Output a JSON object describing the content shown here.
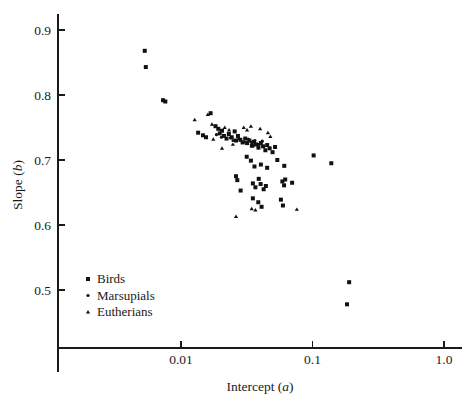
{
  "chart_data": {
    "type": "scatter",
    "title": "",
    "xlabel": "Intercept (a)",
    "xlabel_plain": "Intercept",
    "xlabel_symbol": "a",
    "ylabel": "Slope (b)",
    "ylabel_plain": "Slope",
    "ylabel_symbol": "b",
    "xscale": "log",
    "yscale": "linear",
    "xlim": [
      0.0022,
      1.15
    ],
    "ylim": [
      0.44,
      0.925
    ],
    "xticks": [
      0.01,
      0.1,
      1.0
    ],
    "xtick_labels": [
      "0.01",
      "0.1",
      "1.0"
    ],
    "yticks": [
      0.5,
      0.6,
      0.7,
      0.8,
      0.9
    ],
    "ytick_labels": [
      "0.5",
      "0.6",
      "0.7",
      "0.8",
      "0.9"
    ],
    "grid": false,
    "legend_position": "lower-left",
    "marker_colors": {
      "birds": "#111111",
      "marsupials": "#111111",
      "eutherians": "#111111"
    },
    "series": [
      {
        "name": "Birds",
        "key": "birds",
        "marker": "square",
        "marker_size": 4.0,
        "points": [
          [
            0.0053,
            0.868
          ],
          [
            0.0054,
            0.843
          ],
          [
            0.0073,
            0.792
          ],
          [
            0.0076,
            0.79
          ],
          [
            0.0168,
            0.772
          ],
          [
            0.0135,
            0.742
          ],
          [
            0.0147,
            0.738
          ],
          [
            0.0155,
            0.735
          ],
          [
            0.0183,
            0.752
          ],
          [
            0.0192,
            0.748
          ],
          [
            0.0197,
            0.741
          ],
          [
            0.0205,
            0.745
          ],
          [
            0.0212,
            0.737
          ],
          [
            0.0222,
            0.733
          ],
          [
            0.0231,
            0.74
          ],
          [
            0.0243,
            0.735
          ],
          [
            0.0256,
            0.744
          ],
          [
            0.0262,
            0.73
          ],
          [
            0.0271,
            0.737
          ],
          [
            0.0283,
            0.731
          ],
          [
            0.0294,
            0.727
          ],
          [
            0.0308,
            0.733
          ],
          [
            0.0318,
            0.726
          ],
          [
            0.0331,
            0.73
          ],
          [
            0.0346,
            0.722
          ],
          [
            0.0359,
            0.728
          ],
          [
            0.0372,
            0.724
          ],
          [
            0.0388,
            0.719
          ],
          [
            0.0405,
            0.726
          ],
          [
            0.0421,
            0.721
          ],
          [
            0.0438,
            0.715
          ],
          [
            0.0452,
            0.723
          ],
          [
            0.0472,
            0.718
          ],
          [
            0.0497,
            0.712
          ],
          [
            0.0519,
            0.72
          ],
          [
            0.0316,
            0.705
          ],
          [
            0.034,
            0.699
          ],
          [
            0.0362,
            0.69
          ],
          [
            0.0405,
            0.693
          ],
          [
            0.0452,
            0.688
          ],
          [
            0.0262,
            0.675
          ],
          [
            0.0268,
            0.669
          ],
          [
            0.0352,
            0.664
          ],
          [
            0.0368,
            0.658
          ],
          [
            0.039,
            0.671
          ],
          [
            0.0403,
            0.663
          ],
          [
            0.0425,
            0.655
          ],
          [
            0.0442,
            0.66
          ],
          [
            0.0352,
            0.641
          ],
          [
            0.0387,
            0.635
          ],
          [
            0.041,
            0.628
          ],
          [
            0.059,
            0.667
          ],
          [
            0.0608,
            0.661
          ],
          [
            0.062,
            0.67
          ],
          [
            0.07,
            0.665
          ],
          [
            0.0575,
            0.639
          ],
          [
            0.0596,
            0.63
          ],
          [
            0.102,
            0.707
          ],
          [
            0.139,
            0.695
          ],
          [
            0.19,
            0.512
          ],
          [
            0.183,
            0.478
          ],
          [
            0.0284,
            0.653
          ],
          [
            0.054,
            0.7
          ],
          [
            0.061,
            0.691
          ]
        ]
      },
      {
        "name": "Marsupials",
        "key": "marsupials",
        "marker": "circle",
        "marker_size": 3.2,
        "points": [
          [
            0.0186,
            0.739
          ],
          [
            0.0203,
            0.735
          ],
          [
            0.0238,
            0.734
          ],
          [
            0.0249,
            0.73
          ],
          [
            0.0276,
            0.733
          ],
          [
            0.0302,
            0.728
          ],
          [
            0.0325,
            0.732
          ],
          [
            0.0344,
            0.727
          ],
          [
            0.0365,
            0.73
          ],
          [
            0.0392,
            0.724
          ],
          [
            0.0415,
            0.729
          ]
        ]
      },
      {
        "name": "Eutherians",
        "key": "eutherians",
        "marker": "triangle",
        "marker_size": 3.4,
        "points": [
          [
            0.0127,
            0.762
          ],
          [
            0.016,
            0.77
          ],
          [
            0.0172,
            0.755
          ],
          [
            0.0215,
            0.75
          ],
          [
            0.0232,
            0.746
          ],
          [
            0.0176,
            0.732
          ],
          [
            0.03,
            0.75
          ],
          [
            0.0318,
            0.746
          ],
          [
            0.034,
            0.752
          ],
          [
            0.04,
            0.748
          ],
          [
            0.0248,
            0.724
          ],
          [
            0.0352,
            0.722
          ],
          [
            0.0458,
            0.742
          ],
          [
            0.0478,
            0.736
          ],
          [
            0.0345,
            0.625
          ],
          [
            0.0368,
            0.623
          ],
          [
            0.0262,
            0.613
          ],
          [
            0.076,
            0.624
          ],
          [
            0.0205,
            0.718
          ]
        ]
      }
    ],
    "legend": [
      {
        "label": "Birds",
        "marker": "square"
      },
      {
        "label": "Marsupials",
        "marker": "circle"
      },
      {
        "label": "Eutherians",
        "marker": "triangle"
      }
    ]
  },
  "axes": {
    "x_title_text": "Intercept",
    "x_title_symbol": "a",
    "y_title_text": "Slope",
    "y_title_symbol": "b"
  }
}
